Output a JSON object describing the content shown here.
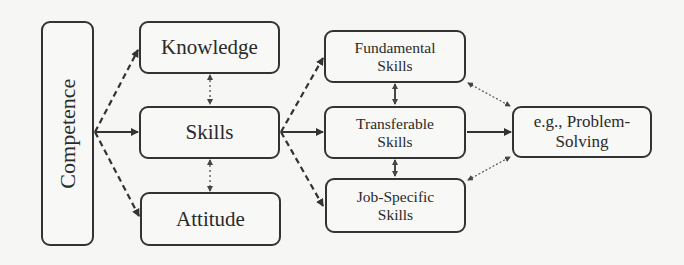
{
  "diagram": {
    "nodes": {
      "competence": {
        "label": "Competence"
      },
      "knowledge": {
        "label": "Knowledge"
      },
      "skills": {
        "label": "Skills"
      },
      "attitude": {
        "label": "Attitude"
      },
      "fundamental": {
        "label": "Fundamental\nSkills"
      },
      "transferable": {
        "label": "Transferable\nSkills"
      },
      "job_specific": {
        "label": "Job-Specific\nSkills"
      },
      "problem_solving": {
        "label": "e.g., Problem-\nSolving"
      }
    },
    "edges": [
      {
        "from": "Competence",
        "to": "Knowledge",
        "style": "dashed",
        "direction": "forward"
      },
      {
        "from": "Competence",
        "to": "Skills",
        "style": "solid",
        "direction": "forward"
      },
      {
        "from": "Competence",
        "to": "Attitude",
        "style": "dashed",
        "direction": "forward"
      },
      {
        "from": "Knowledge",
        "to": "Skills",
        "style": "dotted",
        "direction": "both"
      },
      {
        "from": "Skills",
        "to": "Attitude",
        "style": "dotted",
        "direction": "both"
      },
      {
        "from": "Skills",
        "to": "Fundamental Skills",
        "style": "dashed",
        "direction": "forward"
      },
      {
        "from": "Skills",
        "to": "Transferable Skills",
        "style": "solid",
        "direction": "forward"
      },
      {
        "from": "Skills",
        "to": "Job-Specific Skills",
        "style": "dashed",
        "direction": "forward"
      },
      {
        "from": "Fundamental Skills",
        "to": "Transferable Skills",
        "style": "solid",
        "direction": "both"
      },
      {
        "from": "Transferable Skills",
        "to": "Job-Specific Skills",
        "style": "solid",
        "direction": "both"
      },
      {
        "from": "Fundamental Skills",
        "to": "e.g., Problem-Solving",
        "style": "dotted",
        "direction": "both"
      },
      {
        "from": "Transferable Skills",
        "to": "e.g., Problem-Solving",
        "style": "solid",
        "direction": "forward"
      },
      {
        "from": "Job-Specific Skills",
        "to": "e.g., Problem-Solving",
        "style": "dotted",
        "direction": "both"
      }
    ],
    "colors": {
      "background": "#f6f6f4",
      "stroke": "#333333",
      "text": "#2a2a2a"
    }
  }
}
